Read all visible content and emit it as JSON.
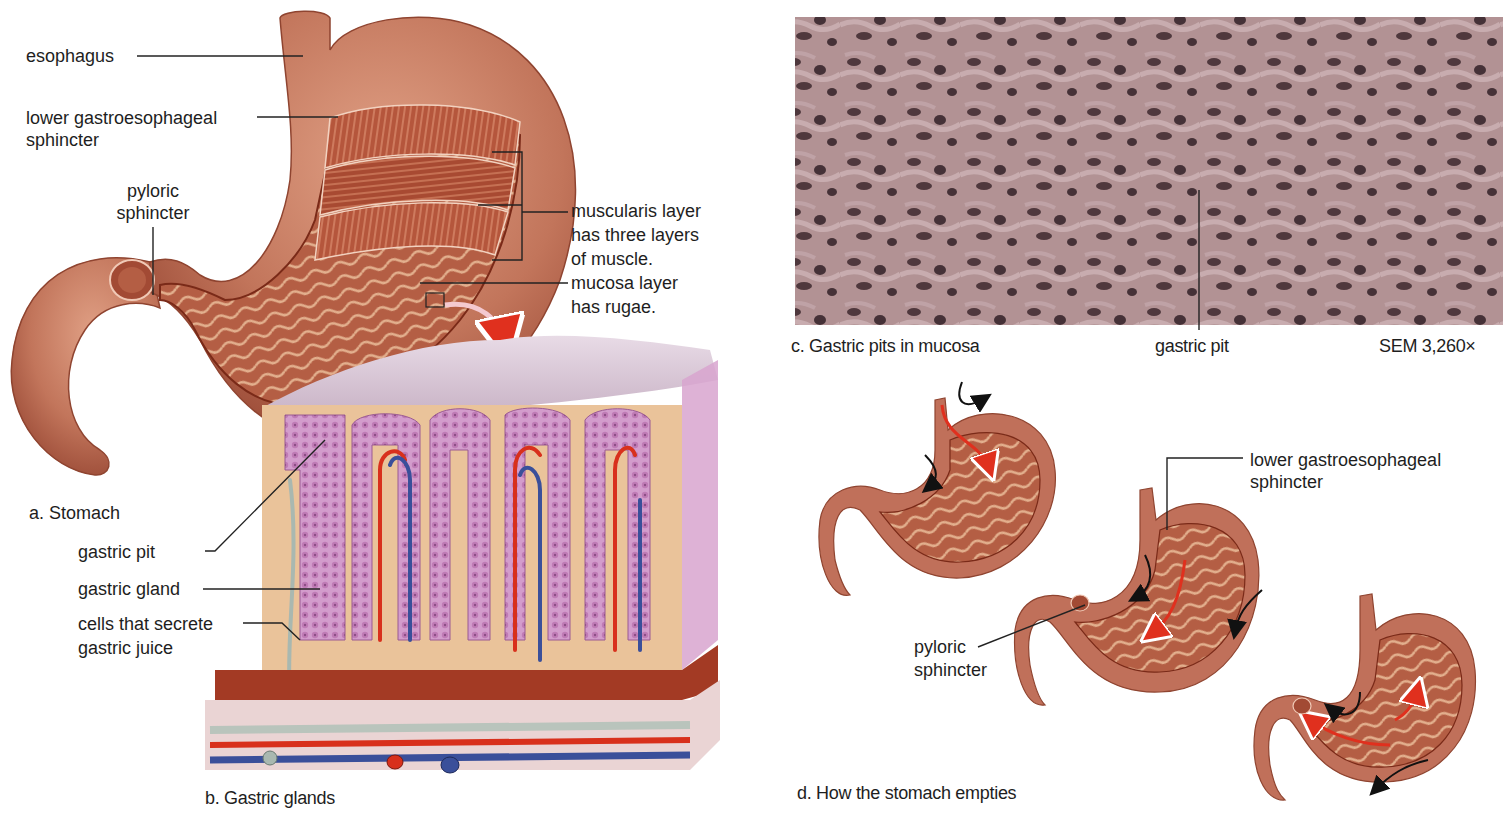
{
  "figure": {
    "panels": [
      {
        "id": "a",
        "caption": "a. Stomach"
      },
      {
        "id": "b",
        "caption": "b. Gastric glands"
      },
      {
        "id": "c",
        "caption": "c. Gastric pits in mucosa"
      },
      {
        "id": "d",
        "caption": "d. How the stomach empties"
      }
    ]
  },
  "panel_a": {
    "caption": "a. Stomach",
    "labels": {
      "esophagus": "esophagus",
      "lower_sphincter": [
        "lower gastroesophageal",
        "sphincter"
      ],
      "pyloric_sphincter": [
        "pyloric",
        "sphincter"
      ],
      "muscularis": [
        "muscularis layer",
        "has three layers",
        "of muscle."
      ],
      "mucosa": [
        "mucosa layer",
        "has rugae."
      ]
    }
  },
  "panel_b": {
    "caption": "b. Gastric glands",
    "labels": {
      "gastric_pit": "gastric pit",
      "gastric_gland": "gastric gland",
      "secreting_cells": [
        "cells that secrete",
        "gastric juice"
      ]
    }
  },
  "panel_c": {
    "caption": "c. Gastric pits in mucosa",
    "pointer_label": "gastric pit",
    "magnification": "SEM 3,260×"
  },
  "panel_d": {
    "caption": "d. How the stomach empties",
    "labels": {
      "lower_sphincter": [
        "lower gastroesophageal",
        "sphincter"
      ],
      "pyloric_sphincter": [
        "pyloric",
        "sphincter"
      ]
    },
    "stages": 3
  },
  "colors": {
    "stomach_outer": "#c0705a",
    "stomach_inner": "#a8452e",
    "rugae": "#d9a07e",
    "mucosa_pink": "#c98fc0",
    "connective_tissue": "#e9c08e",
    "artery": "#d8301c",
    "vein": "#3a4f9a",
    "nerve": "#a9b8b0",
    "sem_base": "#a78a8a",
    "flow_arrow": "#e0301e"
  }
}
